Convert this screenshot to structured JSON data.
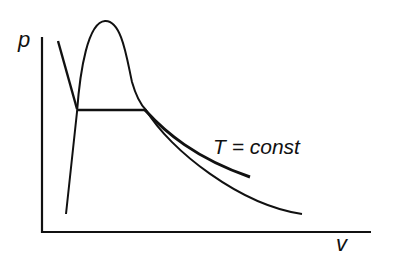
{
  "diagram": {
    "type": "p-v phase diagram",
    "axes": {
      "y_label": "p",
      "x_label": "v"
    },
    "annotations": {
      "isotherm_label": "T = const"
    },
    "curves": [
      {
        "name": "saturation-dome",
        "description": "bell-shaped coexistence curve"
      },
      {
        "name": "liquid-branch-isotherm",
        "description": "steep line on liquid side"
      },
      {
        "name": "coexistence-line",
        "description": "horizontal tie line at constant pressure"
      },
      {
        "name": "isotherm-vapor-branch",
        "description": "T = const curve on vapor side (thick)"
      },
      {
        "name": "dome-extension-curve",
        "description": "thin decreasing curve continuing from dome"
      }
    ],
    "colors": {
      "line": "#111111",
      "background": "#ffffff"
    }
  }
}
